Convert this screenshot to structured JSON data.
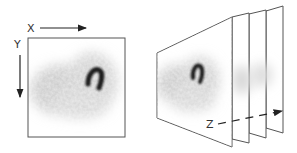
{
  "figure": {
    "left_panel": {
      "axis_x_label": "X",
      "axis_y_label": "Y",
      "description": "Single 2D projection image with blurred activity and dark horseshoe-shaped feature"
    },
    "right_panel": {
      "axis_z_label": "Z",
      "frame_count": 4,
      "description": "Stack of 2D image slices shown in perspective along Z axis"
    },
    "colors": {
      "frame_border": "#555555",
      "arrow": "#222222",
      "background": "#ffffff",
      "blob_dark": "#1a1a1a",
      "blob_light": "#bdbdbd"
    }
  }
}
